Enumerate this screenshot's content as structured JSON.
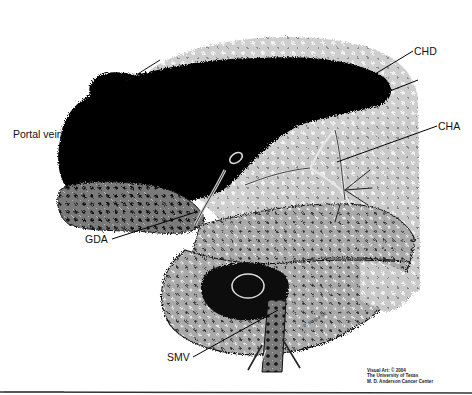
{
  "figure": {
    "type": "anatomical-illustration",
    "labels": [
      {
        "id": "chd",
        "text": "CHD",
        "x": 414,
        "y": 46
      },
      {
        "id": "cha",
        "text": "CHA",
        "x": 440,
        "y": 121
      },
      {
        "id": "portal-vein",
        "text": "Portal vein",
        "x": 13,
        "y": 129
      },
      {
        "id": "gda",
        "text": "GDA",
        "x": 85,
        "y": 238
      },
      {
        "id": "smv",
        "text": "SMV",
        "x": 167,
        "y": 359
      }
    ],
    "artist_signature": "L. D. Wright '04",
    "credit": {
      "line1": "Visual Art: © 2004",
      "line2": "The University of Texas",
      "line3": "M. D. Anderson Cancer Center"
    }
  },
  "colors": {
    "background": "#ffffff",
    "ink": "#000000",
    "stipple": "#8c8c8c",
    "label_text": "#111111"
  }
}
